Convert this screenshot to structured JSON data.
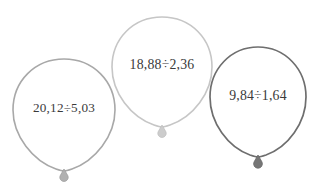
{
  "canvas": {
    "width": 319,
    "height": 190,
    "background": "#ffffff"
  },
  "figure": {
    "type": "balloons-with-expressions",
    "count": 3,
    "text_color": "#3a3a3a"
  },
  "balloons": [
    {
      "id": "balloon-1",
      "expression": "20,12÷5,03",
      "dividend": "20,12",
      "divisor": "5,03",
      "operator": "÷",
      "outline_color": "#a8a8a8",
      "knot_color": "#b0b0b0",
      "position": {
        "x": 11,
        "y": 58
      },
      "size": {
        "width": 105,
        "height": 120
      }
    },
    {
      "id": "balloon-2",
      "expression": "18,88÷2,36",
      "dividend": "18,88",
      "divisor": "2,36",
      "operator": "÷",
      "outline_color": "#c6c6c6",
      "knot_color": "#cccccc",
      "position": {
        "x": 110,
        "y": 16
      },
      "size": {
        "width": 103,
        "height": 118
      }
    },
    {
      "id": "balloon-3",
      "expression": "9,84÷1,64",
      "dividend": "9,84",
      "divisor": "1,64",
      "operator": "÷",
      "outline_color": "#6e6e6e",
      "knot_color": "#767676",
      "position": {
        "x": 208,
        "y": 46
      },
      "size": {
        "width": 99,
        "height": 118
      }
    }
  ]
}
